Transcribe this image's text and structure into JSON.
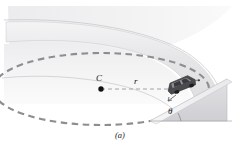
{
  "figure": {
    "caption": "(a)",
    "labels": {
      "center": "C",
      "radius": "r",
      "bank_angle": "θ"
    },
    "icons": {
      "car": "car-icon",
      "center_point": "center-dot-icon",
      "path": "dashed-circular-path-icon",
      "wedge": "bank-wedge-icon"
    },
    "colors": {
      "background": "#ffffff",
      "track_surface": "#e4e4e6",
      "track_surface_light": "#efeff1",
      "track_band": "#eaeaec",
      "wedge_face": "#d9d9dc",
      "wedge_top": "#f2f2f3",
      "dashed_path": "#8e8e93",
      "outline": "#b4b4b8",
      "car_body": "#3a3a3c",
      "car_window": "#6e6e73",
      "label_text": "#141414"
    },
    "geometry": {
      "center_point": [
        101,
        89
      ],
      "radius_line_end": [
        176,
        89
      ],
      "bank_angle_value": "θ",
      "path_type": "ellipse",
      "path_rx": 108,
      "path_ry": 36
    }
  }
}
